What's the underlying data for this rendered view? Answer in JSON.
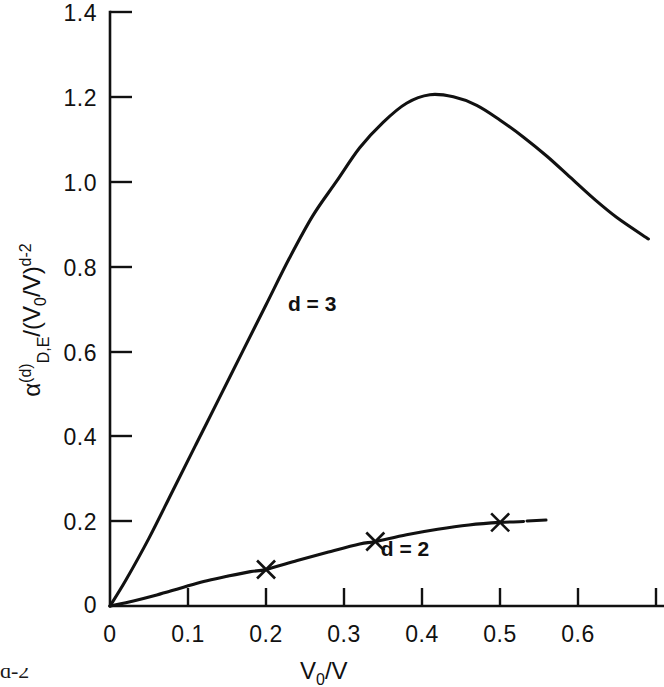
{
  "figure": {
    "background_color": "#ffffff",
    "ink_color": "#111111"
  },
  "chart_data": {
    "type": "line",
    "title": "",
    "subtitle": "",
    "xlabel": "V0/V",
    "xlabel_parts": {
      "main": "V",
      "sub": "0",
      "separator": "/",
      "tail": "V"
    },
    "ylabel": "alpha_{D,E}^{(d)} / (V0/V)^{d-2}",
    "ylabel_parts": {
      "symbol": "α",
      "superscript": "(d)",
      "subscript": "D,E",
      "divider": "/(",
      "ratio_main": "V",
      "ratio_sub": "0",
      "ratio_sep": "/",
      "ratio_tail": "V)",
      "exponent": "d-2"
    },
    "grid": false,
    "legend": "inline-curve-labels",
    "xlim": [
      0,
      0.71
    ],
    "ylim": [
      0,
      1.4
    ],
    "xticks": [
      0,
      0.1,
      0.2,
      0.3,
      0.4,
      0.5,
      0.6
    ],
    "xtick_labels": [
      "0",
      "0.1",
      "0.2",
      "0.3",
      "0.4",
      "0.5",
      "0.6"
    ],
    "yticks": [
      0,
      0.2,
      0.4,
      0.6,
      0.8,
      1.0,
      1.2,
      1.4
    ],
    "ytick_labels": [
      "0",
      "0.2",
      "0.4",
      "0.6",
      "0.8",
      "1.0",
      "1.2",
      "1.4"
    ],
    "series": [
      {
        "name": "d = 3",
        "label": "d = 3",
        "label_x": 0.228,
        "label_y": 0.695,
        "marker": "none",
        "x": [
          0.0,
          0.02,
          0.05,
          0.08,
          0.11,
          0.14,
          0.17,
          0.2,
          0.23,
          0.26,
          0.29,
          0.32,
          0.35,
          0.38,
          0.41,
          0.44,
          0.47,
          0.5,
          0.53,
          0.56,
          0.59,
          0.62,
          0.65,
          0.69
        ],
        "y": [
          0.0,
          0.06,
          0.16,
          0.27,
          0.38,
          0.49,
          0.6,
          0.71,
          0.82,
          0.92,
          1.0,
          1.08,
          1.14,
          1.185,
          1.205,
          1.2,
          1.18,
          1.145,
          1.105,
          1.06,
          1.01,
          0.96,
          0.915,
          0.865
        ],
        "peak": {
          "x": 0.41,
          "y": 1.205
        }
      },
      {
        "name": "d = 2",
        "label": "d = 2",
        "label_x": 0.347,
        "label_y": 0.118,
        "marker": "x",
        "x": [
          0.0,
          0.03,
          0.06,
          0.09,
          0.12,
          0.15,
          0.18,
          0.2,
          0.24,
          0.28,
          0.32,
          0.34,
          0.38,
          0.42,
          0.46,
          0.5,
          0.53
        ],
        "y": [
          0.0,
          0.012,
          0.026,
          0.042,
          0.058,
          0.07,
          0.081,
          0.086,
          0.107,
          0.127,
          0.146,
          0.152,
          0.168,
          0.181,
          0.191,
          0.197,
          0.199
        ],
        "markers": [
          {
            "x": 0.2,
            "y": 0.086
          },
          {
            "x": 0.34,
            "y": 0.152
          },
          {
            "x": 0.5,
            "y": 0.197
          }
        ]
      }
    ]
  },
  "caption": {
    "visible_fragment": "d-2"
  }
}
